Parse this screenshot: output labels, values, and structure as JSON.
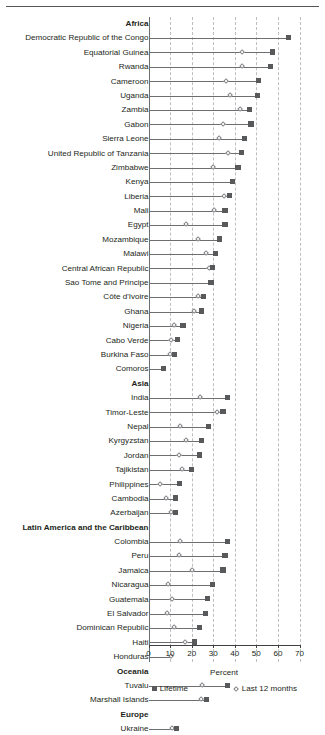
{
  "chart_data": {
    "type": "scatter",
    "subtype": "dumbbell-dot-plot",
    "title": "",
    "xlabel": "Percent",
    "ylabel": "",
    "xlim": [
      0,
      70
    ],
    "xticks": [
      0,
      10,
      20,
      30,
      40,
      50,
      60,
      70
    ],
    "xticklabels": [
      "0",
      "10",
      "20",
      "30",
      "40",
      "50",
      "60",
      "70"
    ],
    "grid": "vertical-dashed",
    "legend_position": "below-axis",
    "legend": [
      {
        "name": "Lifetime",
        "marker": "square",
        "color": "#58595b"
      },
      {
        "name": "Last 12 months",
        "marker": "diamond",
        "color": "#808285"
      }
    ],
    "series": [
      {
        "name": "Lifetime",
        "marker": "square"
      },
      {
        "name": "Last 12 months",
        "marker": "diamond"
      }
    ],
    "rows": [
      {
        "label": "Africa",
        "type": "group"
      },
      {
        "label": "Democratic Republic of the Congo",
        "type": "data",
        "lifetime": 65.0,
        "last12": null
      },
      {
        "label": "Equatorial Guinea",
        "type": "data",
        "lifetime": 57.5,
        "last12": 43.5
      },
      {
        "label": "Rwanda",
        "type": "data",
        "lifetime": 56.5,
        "last12": 43.5
      },
      {
        "label": "Cameroon",
        "type": "data",
        "lifetime": 51.0,
        "last12": 36.0
      },
      {
        "label": "Uganda",
        "type": "data",
        "lifetime": 50.5,
        "last12": 38.0
      },
      {
        "label": "Zambia",
        "type": "data",
        "lifetime": 47.0,
        "last12": 42.5
      },
      {
        "label": "Gabon",
        "type": "data",
        "lifetime": 47.5,
        "last12": 34.5
      },
      {
        "label": "Sierra Leone",
        "type": "data",
        "lifetime": 44.5,
        "last12": 32.5
      },
      {
        "label": "United Republic of Tanzania",
        "type": "data",
        "lifetime": 43.0,
        "last12": 37.0
      },
      {
        "label": "Zimbabwe",
        "type": "data",
        "lifetime": 41.5,
        "last12": 30.0
      },
      {
        "label": "Kenya",
        "type": "data",
        "lifetime": 39.0,
        "last12": null
      },
      {
        "label": "Liberia",
        "type": "data",
        "lifetime": 37.5,
        "last12": 35.0
      },
      {
        "label": "Mali",
        "type": "data",
        "lifetime": 35.5,
        "last12": 30.5
      },
      {
        "label": "Egypt",
        "type": "data",
        "lifetime": 35.5,
        "last12": 17.5
      },
      {
        "label": "Mozambique",
        "type": "data",
        "lifetime": 33.0,
        "last12": 23.0
      },
      {
        "label": "Malawi",
        "type": "data",
        "lifetime": 31.0,
        "last12": 26.5
      },
      {
        "label": "Central African Republic",
        "type": "data",
        "lifetime": 29.5,
        "last12": 28.0
      },
      {
        "label": "Sao Tome and Principe",
        "type": "data",
        "lifetime": 29.0,
        "last12": null
      },
      {
        "label": "Côte d'Ivoire",
        "type": "data",
        "lifetime": 25.5,
        "last12": 23.0
      },
      {
        "label": "Ghana",
        "type": "data",
        "lifetime": 24.5,
        "last12": 21.0
      },
      {
        "label": "Nigeria",
        "type": "data",
        "lifetime": 16.0,
        "last12": 12.0
      },
      {
        "label": "Cabo Verde",
        "type": "data",
        "lifetime": 13.5,
        "last12": 10.5
      },
      {
        "label": "Burkina Faso",
        "type": "data",
        "lifetime": 12.0,
        "last12": 10.0
      },
      {
        "label": "Comoros",
        "type": "data",
        "lifetime": 7.0,
        "last12": null
      },
      {
        "label": "Asia",
        "type": "group"
      },
      {
        "label": "India",
        "type": "data",
        "lifetime": 36.5,
        "last12": 24.0
      },
      {
        "label": "Timor-Leste",
        "type": "data",
        "lifetime": 34.5,
        "last12": 32.0
      },
      {
        "label": "Nepal",
        "type": "data",
        "lifetime": 28.0,
        "last12": 14.5
      },
      {
        "label": "Kyrgyzstan",
        "type": "data",
        "lifetime": 24.5,
        "last12": 17.5
      },
      {
        "label": "Jordan",
        "type": "data",
        "lifetime": 23.5,
        "last12": 14.0
      },
      {
        "label": "Tajikistan",
        "type": "data",
        "lifetime": 20.0,
        "last12": 15.5
      },
      {
        "label": "Philippines",
        "type": "data",
        "lifetime": 14.5,
        "last12": 5.5
      },
      {
        "label": "Cambodia",
        "type": "data",
        "lifetime": 12.5,
        "last12": 8.0
      },
      {
        "label": "Azerbaijan",
        "type": "data",
        "lifetime": 12.5,
        "last12": 10.5
      },
      {
        "label": "Latin America and the Caribbean",
        "type": "group"
      },
      {
        "label": "Colombia",
        "type": "data",
        "lifetime": 36.5,
        "last12": 14.5
      },
      {
        "label": "Peru",
        "type": "data",
        "lifetime": 35.5,
        "last12": 14.0
      },
      {
        "label": "Jamaica",
        "type": "data",
        "lifetime": 34.5,
        "last12": 20.0
      },
      {
        "label": "Nicaragua",
        "type": "data",
        "lifetime": 29.5,
        "last12": 9.0
      },
      {
        "label": "Guatemala",
        "type": "data",
        "lifetime": 27.5,
        "last12": 11.0
      },
      {
        "label": "El Salvador",
        "type": "data",
        "lifetime": 26.5,
        "last12": 8.5
      },
      {
        "label": "Dominican Republic",
        "type": "data",
        "lifetime": 23.5,
        "last12": 12.0
      },
      {
        "label": "Haiti",
        "type": "data",
        "lifetime": 21.5,
        "last12": 17.0
      },
      {
        "label": "Honduras",
        "type": "data",
        "lifetime": null,
        "last12": 10.5
      },
      {
        "label": "Oceania",
        "type": "group"
      },
      {
        "label": "Tuvalu",
        "type": "data",
        "lifetime": 36.5,
        "last12": 25.0
      },
      {
        "label": "Marshall Islands",
        "type": "data",
        "lifetime": 27.0,
        "last12": 24.5
      },
      {
        "label": "Europe",
        "type": "group"
      },
      {
        "label": "Ukraine",
        "type": "data",
        "lifetime": 13.0,
        "last12": 11.0
      }
    ]
  }
}
